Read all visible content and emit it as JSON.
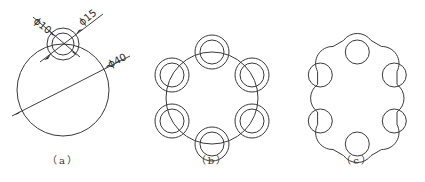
{
  "figure": {
    "panels": [
      {
        "id": "a",
        "label": "（a）",
        "dimensions": [
          {
            "name": "small-hole-diameter",
            "text": "ϕ10",
            "value": 10
          },
          {
            "name": "boss-diameter",
            "text": "ϕ15",
            "value": 15
          },
          {
            "name": "pitch-circle-diameter",
            "text": "ϕ40",
            "value": 40
          }
        ],
        "description": "Large circle with one concentric pair of small circles on top"
      },
      {
        "id": "b",
        "label": "（b）",
        "pattern_count": 6,
        "description": "Six concentric circle pairs arrayed around the large circle"
      },
      {
        "id": "c",
        "label": "（c）",
        "pattern_count": 6,
        "description": "Trimmed outline: outer lobed profile with six holes"
      }
    ],
    "caption": ""
  },
  "colors": {
    "line": "#3a3a3a",
    "background": "#ffffff"
  }
}
